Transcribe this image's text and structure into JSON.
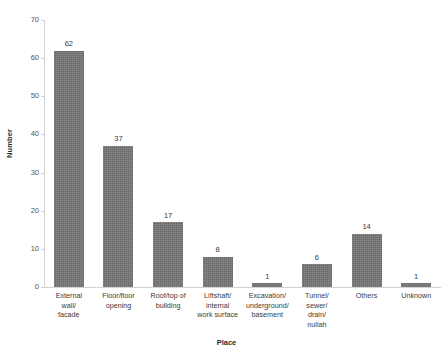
{
  "chart_data": {
    "type": "bar",
    "title": "",
    "xlabel": "Place",
    "ylabel": "Number",
    "ylim": [
      0,
      70
    ],
    "ytick_step": 10,
    "yticks": [
      0,
      10,
      20,
      30,
      40,
      50,
      60,
      70
    ],
    "grid": false,
    "legend": null,
    "bar_color": "#757575",
    "axis_color": "#d2d2d2",
    "categories": [
      "External wall/ facade",
      "Floor/floor opening",
      "Roof/top of building",
      "Liftshaft/ internal work surface",
      "Excavation/ underground/ basement",
      "Tunnel/ sewer/ drain/ nullah",
      "Others",
      "Unknown"
    ],
    "category_lines": [
      [
        "External",
        "wall/",
        "facade"
      ],
      [
        "Floor/floor",
        "opening"
      ],
      [
        "Roof/top of",
        "building"
      ],
      [
        "Liftshaft/",
        "internal",
        "work surface"
      ],
      [
        "Excavation/",
        "underground/",
        "basement"
      ],
      [
        "Tunnel/",
        "sewer/",
        "drain/",
        "nullah"
      ],
      [
        "Others"
      ],
      [
        "Unknown"
      ]
    ],
    "values": [
      62,
      37,
      17,
      8,
      1,
      6,
      14,
      1
    ],
    "value_labels": [
      "62",
      "37",
      "17",
      "8",
      "1",
      "6",
      "14",
      "1"
    ]
  }
}
